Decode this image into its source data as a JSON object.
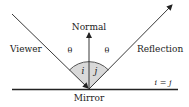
{
  "diagram": {
    "labels": {
      "normal": "Normal",
      "viewer": "Viewer",
      "reflection": "Reflection",
      "mirror": "Mirror",
      "theta_left": "θ",
      "theta_right": "θ",
      "angle_i": "i",
      "angle_j": "j",
      "equation": "i = j"
    },
    "colors": {
      "line": "#222222",
      "arc_fill": "#d9d9d9",
      "arc_stroke": "#555555"
    }
  }
}
